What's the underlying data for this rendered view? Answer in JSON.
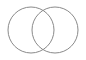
{
  "figure": {
    "name": "two-circle-venn-diagram",
    "width": 86,
    "height": 60,
    "background_color": "#ffffff",
    "fill": "none",
    "stroke_color": "#8a8a8a",
    "stroke_width": 1,
    "title": "",
    "labels": [],
    "annotations": []
  },
  "chart_data": {
    "type": "diagram",
    "subtype": "venn",
    "title": "",
    "xlabel": "",
    "ylabel": "",
    "grid": false,
    "legend": "none",
    "set_count": 2,
    "filled": false,
    "sets": [
      {
        "name": "left-set",
        "label": "",
        "cx": 31,
        "cy": 30,
        "r": 23,
        "fill": "none",
        "stroke": "#8a8a8a"
      },
      {
        "name": "right-set",
        "label": "",
        "cx": 55,
        "cy": 30,
        "r": 23,
        "fill": "none",
        "stroke": "#8a8a8a"
      }
    ],
    "intersection": {
      "label": "",
      "top_point": [
        43,
        7
      ],
      "bottom_point": [
        43,
        53
      ],
      "filled": false
    }
  }
}
